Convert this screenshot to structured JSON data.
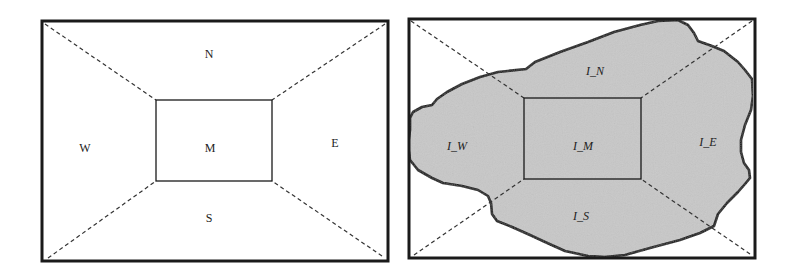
{
  "left_panel": {
    "regions": {
      "north": "N",
      "south": "S",
      "west": "W",
      "east": "E",
      "middle": "M"
    }
  },
  "right_panel": {
    "regions": {
      "north": "I_N",
      "south": "I_S",
      "west": "I_W",
      "east": "I_E",
      "middle": "I_M"
    },
    "object_fill": "#c8c8c8"
  },
  "colors": {
    "stroke": "#1a1a1a",
    "background": "#ffffff"
  }
}
